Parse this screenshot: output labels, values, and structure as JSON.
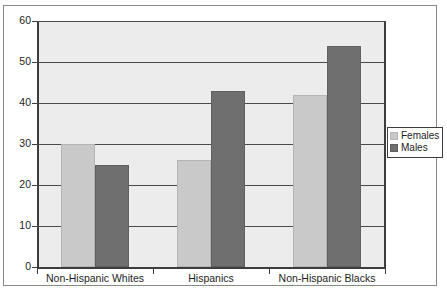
{
  "chart_data": {
    "type": "bar",
    "title": "",
    "subtitle": "",
    "xlabel": "",
    "ylabel": "",
    "categories": [
      "Non-Hispanic Whites",
      "Hispanics",
      "Non-Hispanic Blacks"
    ],
    "series": [
      {
        "name": "Females",
        "color": "#c9c9c9",
        "values": [
          30,
          26,
          42
        ]
      },
      {
        "name": "Males",
        "color": "#6f6f6f",
        "values": [
          25,
          43,
          54
        ]
      }
    ],
    "ylim": [
      0,
      60
    ],
    "ytick_labels": [
      "0",
      "10",
      "20",
      "30",
      "40",
      "50",
      "60"
    ],
    "ytick_values": [
      0,
      10,
      20,
      30,
      40,
      50,
      60
    ],
    "grid": true,
    "grid_axis": "y",
    "legend_position": "right",
    "legend_entries": [
      "Females",
      "Males"
    ],
    "annotations": []
  },
  "figure": {
    "background_color": "#ffffff",
    "plot_background_color": "#ececec",
    "frame_color": "#8a8a8a",
    "axis_color": "#3d3d3d",
    "grid_color": "#4a4a4a"
  }
}
